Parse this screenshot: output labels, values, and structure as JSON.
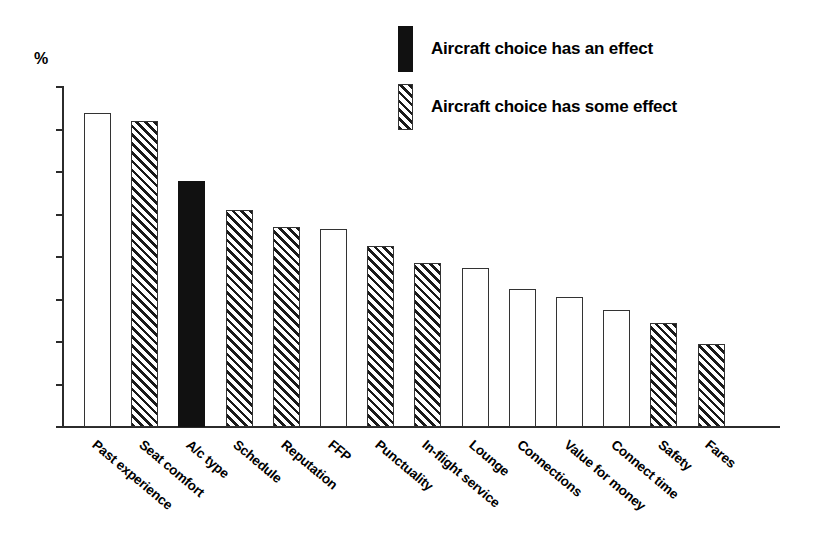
{
  "chart_data": {
    "type": "bar",
    "title": "",
    "subtitle": "",
    "xlabel": "",
    "ylabel": "%",
    "ylim": [
      0,
      80
    ],
    "yticks": [
      0,
      10,
      20,
      30,
      40,
      50,
      60,
      70,
      80
    ],
    "ytick_labels": [
      "0",
      "10",
      "20",
      "30",
      "40",
      "50",
      "60",
      "70",
      "80"
    ],
    "grid": false,
    "legend_position": "top-right",
    "categories": [
      "Past experience",
      "Seat comfort",
      "A/c type",
      "Schedule",
      "Reputation",
      "FFP",
      "Punctuality",
      "In-flight service",
      "Lounge",
      "Connections",
      "Value for money",
      "Connect time",
      "Safety",
      "Fares"
    ],
    "values": [
      74,
      72,
      58,
      51,
      47,
      46.5,
      42.5,
      38.5,
      37.5,
      32.5,
      30.5,
      27.5,
      24.5,
      19.5
    ],
    "fills": [
      "none",
      "hatch",
      "solid",
      "hatch",
      "hatch",
      "none",
      "hatch",
      "hatch",
      "none",
      "none",
      "none",
      "none",
      "hatch",
      "hatch"
    ],
    "legend": [
      {
        "fill": "solid",
        "label": "Aircraft choice has an effect"
      },
      {
        "fill": "hatch",
        "label": "Aircraft choice has some effect"
      }
    ],
    "colors": {
      "solid_fill": "#111111",
      "hatch_line": "#1a1a1a",
      "bar_outline": "#333333",
      "axis": "#2b2b2b",
      "background": "#ffffff",
      "text": "#000000"
    }
  }
}
